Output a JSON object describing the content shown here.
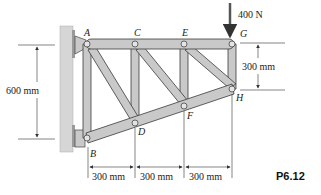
{
  "figure": {
    "id_label": "P6.12",
    "type": "truss-diagram"
  },
  "load": {
    "label": "400 N",
    "joint": "G",
    "direction": "down"
  },
  "joints": [
    {
      "name": "A"
    },
    {
      "name": "B"
    },
    {
      "name": "C"
    },
    {
      "name": "D"
    },
    {
      "name": "E"
    },
    {
      "name": "F"
    },
    {
      "name": "G"
    },
    {
      "name": "H"
    }
  ],
  "dimensions": {
    "left_height": "600 mm",
    "right_height": "300 mm",
    "bottom_spans": [
      "300 mm",
      "300 mm",
      "300 mm"
    ]
  },
  "colors": {
    "member_fill": "#c9c9c9",
    "member_stroke": "#3a3a3a",
    "wall_fill": "#d4d4d4",
    "dimension_line": "#333333"
  }
}
